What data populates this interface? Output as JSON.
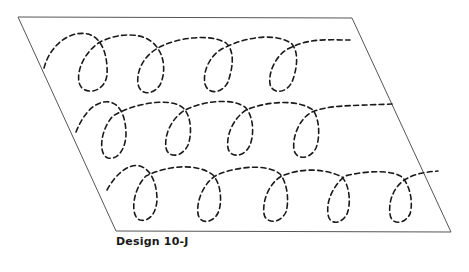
{
  "figure": {
    "caption": "Design 10-J",
    "stroke_color": "#1a1a1a",
    "border_color": "#555555",
    "frame": {
      "shape": "parallelogram",
      "corners": [
        [
          18,
          17
        ],
        [
          352,
          18
        ],
        [
          451,
          232
        ],
        [
          116,
          231
        ]
      ]
    },
    "rows": [
      {
        "name": "top-row",
        "loops": 5
      },
      {
        "name": "middle-row",
        "loops": 5
      },
      {
        "name": "bottom-row",
        "loops": 5
      }
    ]
  }
}
